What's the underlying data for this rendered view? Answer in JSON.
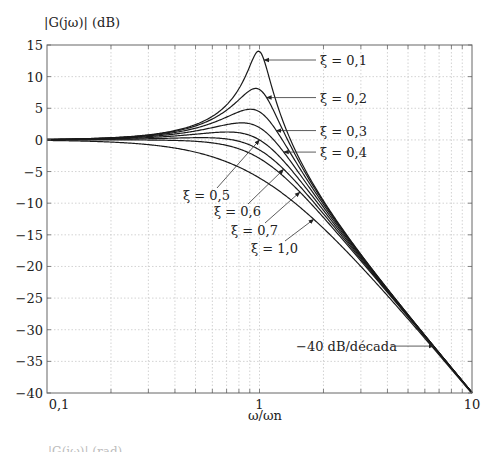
{
  "chart_data": {
    "type": "line",
    "title": "",
    "ylabel": "|G(jω)| (dB)",
    "xlabel": "ω/ωn",
    "xscale": "log",
    "xlim": [
      0.1,
      10
    ],
    "ylim": [
      -40,
      15
    ],
    "x_ticks": [
      0.1,
      1,
      10
    ],
    "x_tick_labels": [
      "0,1",
      "1",
      "10"
    ],
    "y_ticks": [
      15,
      10,
      5,
      0,
      -5,
      -10,
      -15,
      -20,
      -25,
      -30,
      -35,
      -40
    ],
    "y_tick_labels": [
      "15",
      "10",
      "5",
      "0",
      "−5",
      "−10",
      "−15",
      "−20",
      "−25",
      "−30",
      "−35",
      "−40"
    ],
    "grid": true,
    "grid_style": "dotted",
    "legend": null,
    "series": [
      {
        "name": "ξ = 0,1",
        "zeta": 0.1,
        "peak_db": 14.0
      },
      {
        "name": "ξ = 0,2",
        "zeta": 0.2,
        "peak_db": 8.1
      },
      {
        "name": "ξ = 0,3",
        "zeta": 0.3,
        "peak_db": 4.8
      },
      {
        "name": "ξ = 0,4",
        "zeta": 0.4,
        "peak_db": 2.7
      },
      {
        "name": "ξ = 0,5",
        "zeta": 0.5,
        "peak_db": 1.2
      },
      {
        "name": "ξ = 0,6",
        "zeta": 0.6,
        "peak_db": 0.35
      },
      {
        "name": "ξ = 0,7",
        "zeta": 0.7,
        "peak_db": 0.0
      },
      {
        "name": "ξ = 1,0",
        "zeta": 1.0,
        "peak_db": 0.0
      }
    ],
    "formula": "|G(jω)| dB = -10·log10((1-(ω/ωn)^2)^2 + (2ξ ω/ωn)^2)",
    "annotations": [
      {
        "text": "ξ = 0,1",
        "label_x": 320,
        "label_y": 69,
        "arrow_to_x": 1.05
      },
      {
        "text": "ξ = 0,2",
        "label_x": 320,
        "label_y": 97,
        "arrow_to_x": 1.08
      },
      {
        "text": "ξ = 0,3",
        "label_x": 320,
        "label_y": 129,
        "arrow_to_x": 1.2
      },
      {
        "text": "ξ = 0,4",
        "label_x": 320,
        "label_y": 161,
        "arrow_to_x": 1.3
      },
      {
        "text": "ξ = 0,5",
        "label_x": 195,
        "label_y": 200,
        "arrow_to_x": 1.0
      },
      {
        "text": "ξ = 0,6",
        "label_x": 226,
        "label_y": 216,
        "arrow_to_x": 1.3
      },
      {
        "text": "ξ = 0,7",
        "label_x": 243,
        "label_y": 235,
        "arrow_to_x": 1.55
      },
      {
        "text": "ξ = 1,0",
        "label_x": 263,
        "label_y": 253,
        "arrow_to_x": 1.8
      },
      {
        "text": "−40 dB/década",
        "label_x": 296,
        "label_y": 353,
        "arrow_to_x": 6.6
      }
    ]
  },
  "texts": {
    "ylabel": "|G(jω)| (dB)",
    "xlabel": "ω/ωn",
    "slope_label": "−40 dB/década",
    "cut_caption": "|G(jω)| (rad)"
  },
  "colors": {
    "curve": "#1a1a1a",
    "axis": "#555555",
    "grid": "#c8c8c8",
    "text": "#222222"
  }
}
